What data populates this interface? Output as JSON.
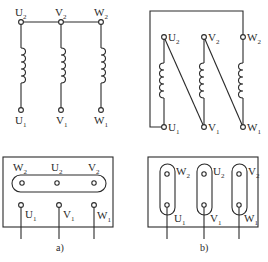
{
  "figure": {
    "panel_a": {
      "caption": "a)",
      "connection": "star",
      "top_terminals": [
        {
          "base": "U",
          "sub": "2"
        },
        {
          "base": "V",
          "sub": "2"
        },
        {
          "base": "W",
          "sub": "2"
        }
      ],
      "bottom_terminals": [
        {
          "base": "U",
          "sub": "1"
        },
        {
          "base": "V",
          "sub": "1"
        },
        {
          "base": "W",
          "sub": "1"
        }
      ],
      "terminal_box": {
        "top_row": [
          {
            "base": "W",
            "sub": "2"
          },
          {
            "base": "U",
            "sub": "2"
          },
          {
            "base": "V",
            "sub": "2"
          }
        ],
        "bottom_row": [
          {
            "base": "U",
            "sub": "1"
          },
          {
            "base": "V",
            "sub": "1"
          },
          {
            "base": "W",
            "sub": "1"
          }
        ]
      }
    },
    "panel_b": {
      "caption": "b)",
      "connection": "delta",
      "top_terminals": [
        {
          "base": "U",
          "sub": "2"
        },
        {
          "base": "V",
          "sub": "2"
        },
        {
          "base": "W",
          "sub": "2"
        }
      ],
      "bottom_terminals": [
        {
          "base": "U",
          "sub": "1"
        },
        {
          "base": "V",
          "sub": "1"
        },
        {
          "base": "W",
          "sub": "1"
        }
      ],
      "terminal_box": {
        "top_row": [
          {
            "base": "W",
            "sub": "2"
          },
          {
            "base": "U",
            "sub": "2"
          },
          {
            "base": "V",
            "sub": "2"
          }
        ],
        "bottom_row": [
          {
            "base": "U",
            "sub": "1"
          },
          {
            "base": "V",
            "sub": "1"
          },
          {
            "base": "W",
            "sub": "1"
          }
        ]
      }
    }
  }
}
